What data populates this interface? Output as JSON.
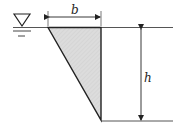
{
  "diagram": {
    "labels": {
      "width": "b",
      "depth": "h"
    },
    "symbols": {
      "free_surface": "water-surface-inverted-triangle"
    },
    "colors": {
      "stroke": "#222222",
      "fill": "#d9d9d9",
      "thin_line": "#555555"
    }
  }
}
